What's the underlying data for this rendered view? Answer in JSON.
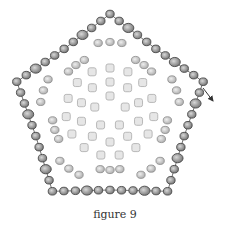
{
  "figure": {
    "caption": "figure 9",
    "colors": {
      "outer_bead_fill": "#9a9a9a",
      "outer_bead_stroke": "#4a4a4a",
      "mid_bead_fill": "#c8c8c8",
      "mid_bead_stroke": "#8a8a8a",
      "inner_bead_fill": "#e6e6e6",
      "inner_bead_stroke": "#b8b8b8",
      "thread": "#333333"
    },
    "thread_exit_arrow": "arrow-icon"
  }
}
